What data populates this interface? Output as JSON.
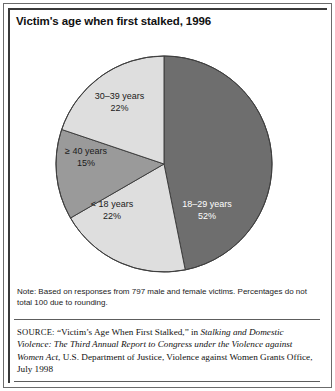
{
  "figure": {
    "title": "Victim's age when first stalked, 1996",
    "note": "Note: Based on responses from 797 male and female victims. Percentages do not total 100 due to rounding.",
    "source_prefix": "SOURCE:",
    "source_quoted_title": "“Victim’s Age When First Stalked,”",
    "source_in": "in",
    "source_italic_title": "Stalking and Domestic Violence: The Third Annual Report to Congress under the Violence against Women Act",
    "source_tail": ", U.S. Department of Justice, Violence against Women Grants Office, July 1998"
  },
  "chart_data": {
    "type": "pie",
    "title": "Victim's age when first stalked, 1996",
    "categories": [
      "18–29 years",
      "< 18 years",
      "≥ 40 years",
      "30–39 years"
    ],
    "values": [
      52,
      22,
      15,
      22
    ],
    "value_labels": [
      "52%",
      "22%",
      "15%",
      "22%"
    ],
    "unit": "percent",
    "total_respondents": 797,
    "start_angle_deg": 0,
    "direction": "clockwise",
    "legend": "none",
    "labels_inside": true,
    "slices": [
      {
        "label": "18–29 years",
        "pct_label": "52%",
        "value": 52,
        "color": "#6e6e6e",
        "text_color": "#ffffff",
        "label_x": 193,
        "label_y": 157
      },
      {
        "label": "< 18 years",
        "pct_label": "22%",
        "value": 22,
        "color": "#dedede",
        "text_color": "#1a1a1a",
        "label_x": 98,
        "label_y": 204
      },
      {
        "label": "≥ 40 years",
        "pct_label": "15%",
        "value": 15,
        "color": "#9a9a9a",
        "text_color": "#1a1a1a",
        "label_x": 62,
        "label_y": 151
      },
      {
        "label": "30–39 years",
        "pct_label": "22%",
        "value": 22,
        "color": "#dedede",
        "text_color": "#1a1a1a",
        "label_x": 103,
        "label_y": 72
      }
    ],
    "geometry": {
      "center_x": 150,
      "center_y": 116,
      "radius": 108
    },
    "colors": {
      "dark_gray": "#6e6e6e",
      "medium_gray": "#9a9a9a",
      "light_gray": "#dedede",
      "outline": "#3f3f3f"
    }
  }
}
